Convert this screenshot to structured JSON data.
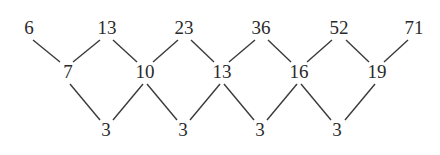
{
  "diagram": {
    "type": "difference-lattice",
    "top_row": [
      {
        "value": "6",
        "x": 29,
        "y": 28
      },
      {
        "value": "13",
        "x": 107,
        "y": 28
      },
      {
        "value": "23",
        "x": 184,
        "y": 28
      },
      {
        "value": "36",
        "x": 261,
        "y": 28
      },
      {
        "value": "52",
        "x": 339,
        "y": 28
      },
      {
        "value": "71",
        "x": 414,
        "y": 28
      }
    ],
    "middle_row": [
      {
        "value": "7",
        "x": 68,
        "y": 72
      },
      {
        "value": "10",
        "x": 145,
        "y": 72
      },
      {
        "value": "13",
        "x": 222,
        "y": 72
      },
      {
        "value": "16",
        "x": 299,
        "y": 72
      },
      {
        "value": "19",
        "x": 377,
        "y": 72
      }
    ],
    "bottom_row": [
      {
        "value": "3",
        "x": 106,
        "y": 130
      },
      {
        "value": "3",
        "x": 183,
        "y": 130
      },
      {
        "value": "3",
        "x": 260,
        "y": 130
      },
      {
        "value": "3",
        "x": 337,
        "y": 130
      }
    ],
    "edges": [
      [
        33,
        40,
        60,
        62
      ],
      [
        100,
        40,
        73,
        62
      ],
      [
        113,
        40,
        137,
        62
      ],
      [
        178,
        40,
        153,
        62
      ],
      [
        191,
        40,
        214,
        62
      ],
      [
        255,
        40,
        229,
        62
      ],
      [
        268,
        40,
        291,
        62
      ],
      [
        332,
        40,
        307,
        62
      ],
      [
        346,
        40,
        369,
        62
      ],
      [
        408,
        40,
        384,
        62
      ],
      [
        70,
        84,
        100,
        120
      ],
      [
        143,
        84,
        113,
        120
      ],
      [
        147,
        84,
        177,
        120
      ],
      [
        220,
        84,
        190,
        120
      ],
      [
        224,
        84,
        254,
        120
      ],
      [
        297,
        84,
        267,
        120
      ],
      [
        301,
        84,
        331,
        120
      ],
      [
        375,
        84,
        345,
        120
      ]
    ]
  }
}
